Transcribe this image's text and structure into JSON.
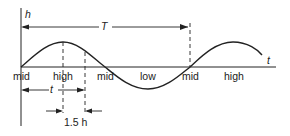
{
  "diagram": {
    "axes": {
      "y_label": "h",
      "x_label": "t"
    },
    "period_label": "T",
    "time_label": "t",
    "offset_label": "1.5 h",
    "phase_labels": [
      "mid",
      "high",
      "mid",
      "low",
      "mid",
      "high"
    ],
    "colors": {
      "line": "#222222",
      "background": "#ffffff"
    }
  }
}
